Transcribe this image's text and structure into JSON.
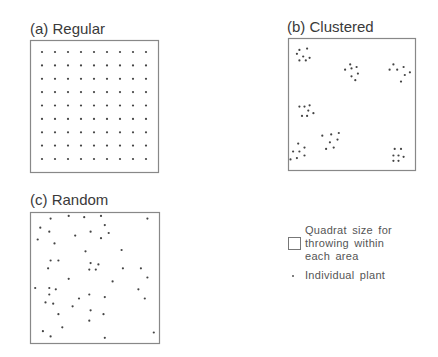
{
  "figure": {
    "panels": [
      {
        "id": "regular",
        "title": "(a) Regular",
        "pattern": "grid",
        "grid": {
          "columns": 9,
          "rows": 9
        }
      },
      {
        "id": "clustered",
        "title": "(b) Clustered",
        "pattern": "clusters",
        "clusters": [
          [
            [
              0.09,
              0.09
            ],
            [
              0.15,
              0.08
            ],
            [
              0.07,
              0.12
            ],
            [
              0.12,
              0.14
            ],
            [
              0.17,
              0.15
            ],
            [
              0.09,
              0.17
            ],
            [
              0.14,
              0.17
            ]
          ],
          [
            [
              0.49,
              0.2
            ],
            [
              0.45,
              0.24
            ],
            [
              0.5,
              0.23
            ],
            [
              0.54,
              0.22
            ],
            [
              0.55,
              0.27
            ],
            [
              0.5,
              0.29
            ],
            [
              0.53,
              0.32
            ]
          ],
          [
            [
              0.83,
              0.2
            ],
            [
              0.8,
              0.24
            ],
            [
              0.86,
              0.24
            ],
            [
              0.91,
              0.22
            ],
            [
              0.92,
              0.28
            ],
            [
              0.96,
              0.26
            ],
            [
              0.89,
              0.33
            ]
          ],
          [
            [
              0.09,
              0.52
            ],
            [
              0.13,
              0.52
            ],
            [
              0.17,
              0.51
            ],
            [
              0.16,
              0.55
            ],
            [
              0.11,
              0.59
            ],
            [
              0.15,
              0.59
            ],
            [
              0.2,
              0.57
            ]
          ],
          [
            [
              0.27,
              0.74
            ],
            [
              0.34,
              0.73
            ],
            [
              0.4,
              0.72
            ],
            [
              0.33,
              0.79
            ],
            [
              0.39,
              0.77
            ],
            [
              0.3,
              0.84
            ],
            [
              0.36,
              0.83
            ]
          ],
          [
            [
              0.08,
              0.8
            ],
            [
              0.13,
              0.83
            ],
            [
              0.04,
              0.86
            ],
            [
              0.09,
              0.86
            ],
            [
              0.02,
              0.92
            ],
            [
              0.07,
              0.91
            ],
            [
              0.13,
              0.89
            ]
          ],
          [
            [
              0.84,
              0.84
            ],
            [
              0.89,
              0.84
            ],
            [
              0.83,
              0.89
            ],
            [
              0.87,
              0.89
            ],
            [
              0.91,
              0.9
            ],
            [
              0.83,
              0.93
            ],
            [
              0.87,
              0.93
            ]
          ]
        ]
      },
      {
        "id": "random",
        "title": "(c) Random",
        "pattern": "random",
        "points": [
          [
            0.16,
            0.05
          ],
          [
            0.3,
            0.03
          ],
          [
            0.42,
            0.04
          ],
          [
            0.55,
            0.03
          ],
          [
            0.91,
            0.05
          ],
          [
            0.08,
            0.12
          ],
          [
            0.58,
            0.1
          ],
          [
            0.15,
            0.15
          ],
          [
            0.47,
            0.15
          ],
          [
            0.61,
            0.16
          ],
          [
            0.35,
            0.18
          ],
          [
            0.55,
            0.2
          ],
          [
            0.06,
            0.21
          ],
          [
            0.19,
            0.24
          ],
          [
            0.43,
            0.3
          ],
          [
            0.71,
            0.29
          ],
          [
            0.16,
            0.37
          ],
          [
            0.22,
            0.37
          ],
          [
            0.47,
            0.39
          ],
          [
            0.53,
            0.4
          ],
          [
            0.14,
            0.43
          ],
          [
            0.46,
            0.44
          ],
          [
            0.51,
            0.44
          ],
          [
            0.72,
            0.43
          ],
          [
            0.86,
            0.43
          ],
          [
            0.91,
            0.5
          ],
          [
            0.3,
            0.51
          ],
          [
            0.64,
            0.53
          ],
          [
            0.04,
            0.58
          ],
          [
            0.15,
            0.58
          ],
          [
            0.2,
            0.59
          ],
          [
            0.84,
            0.59
          ],
          [
            0.15,
            0.63
          ],
          [
            0.46,
            0.63
          ],
          [
            0.38,
            0.66
          ],
          [
            0.58,
            0.65
          ],
          [
            0.89,
            0.66
          ],
          [
            0.12,
            0.69
          ],
          [
            0.18,
            0.7
          ],
          [
            0.33,
            0.72
          ],
          [
            0.47,
            0.75
          ],
          [
            0.22,
            0.78
          ],
          [
            0.57,
            0.78
          ],
          [
            0.46,
            0.83
          ],
          [
            0.25,
            0.88
          ],
          [
            0.1,
            0.91
          ],
          [
            0.96,
            0.92
          ],
          [
            0.16,
            0.95
          ],
          [
            0.58,
            0.96
          ]
        ]
      }
    ],
    "legend": {
      "quadrat_label_lines": [
        "Quadrat size for",
        "throwing within",
        "each area"
      ],
      "plant_label": "Individual plant"
    }
  }
}
